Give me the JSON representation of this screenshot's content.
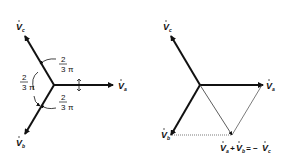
{
  "left_diagram": {
    "title": "Symmetric three-phase phasors",
    "phasors": [
      {
        "name": "V",
        "subscript": "a",
        "direction_deg": 0
      },
      {
        "name": "V",
        "subscript": "c",
        "direction_deg": 120
      },
      {
        "name": "V",
        "subscript": "b",
        "direction_deg": 240
      }
    ],
    "angle_labels": [
      {
        "numerator": "2",
        "denominator": "3",
        "symbol": "π"
      },
      {
        "numerator": "2",
        "denominator": "3",
        "symbol": "π"
      },
      {
        "numerator": "2",
        "denominator": "3",
        "symbol": "π"
      }
    ]
  },
  "right_diagram": {
    "title": "Phasor sum construction",
    "phasors": [
      {
        "name": "V",
        "subscript": "a"
      },
      {
        "name": "V",
        "subscript": "c"
      },
      {
        "name": "V",
        "subscript": "b"
      }
    ],
    "sum_label": {
      "left": "V",
      "left_sub": "a",
      "plus": "+",
      "right": "V",
      "right_sub": "b",
      "equals": "= −",
      "result": "V",
      "result_sub": "c"
    }
  },
  "colors": {
    "stroke": "#111111",
    "thin": "#555555",
    "background": "#ffffff"
  }
}
